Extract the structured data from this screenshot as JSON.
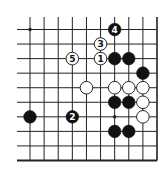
{
  "diagram": {
    "type": "go-board-fragment",
    "columns": 10,
    "rows": 10,
    "edges": [
      "right",
      "bottom"
    ],
    "colors": {
      "black": "#111111",
      "white": "#ffffff",
      "line": "#222222"
    },
    "star_points": [
      {
        "col": 0,
        "row": 0
      },
      {
        "col": 6,
        "row": 6
      }
    ],
    "stones": [
      {
        "col": 6,
        "row": 0,
        "color": "black",
        "label": "4"
      },
      {
        "col": 5,
        "row": 1,
        "color": "white",
        "label": "3"
      },
      {
        "col": 3,
        "row": 2,
        "color": "white",
        "label": "5"
      },
      {
        "col": 5,
        "row": 2,
        "color": "white",
        "label": "1"
      },
      {
        "col": 6,
        "row": 2,
        "color": "black",
        "label": ""
      },
      {
        "col": 7,
        "row": 2,
        "color": "black",
        "label": ""
      },
      {
        "col": 8,
        "row": 3,
        "color": "black",
        "label": ""
      },
      {
        "col": 4,
        "row": 4,
        "color": "white",
        "label": ""
      },
      {
        "col": 6,
        "row": 4,
        "color": "white",
        "label": ""
      },
      {
        "col": 7,
        "row": 4,
        "color": "white",
        "label": ""
      },
      {
        "col": 8,
        "row": 4,
        "color": "white",
        "label": ""
      },
      {
        "col": 6,
        "row": 5,
        "color": "black",
        "label": ""
      },
      {
        "col": 7,
        "row": 5,
        "color": "black",
        "label": ""
      },
      {
        "col": 8,
        "row": 5,
        "color": "white",
        "label": ""
      },
      {
        "col": 0,
        "row": 6,
        "color": "black",
        "label": ""
      },
      {
        "col": 3,
        "row": 6,
        "color": "black",
        "label": "2"
      },
      {
        "col": 8,
        "row": 6,
        "color": "white",
        "label": ""
      },
      {
        "col": 6,
        "row": 7,
        "color": "black",
        "label": ""
      },
      {
        "col": 7,
        "row": 7,
        "color": "black",
        "label": ""
      }
    ]
  }
}
